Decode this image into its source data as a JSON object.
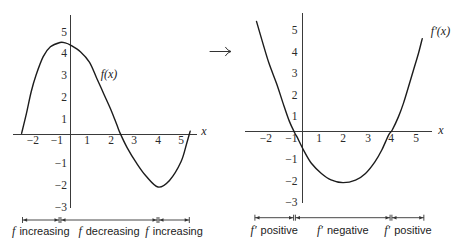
{
  "connector": {
    "icon": "long-right-arrow"
  },
  "colors": {
    "ink": "#1c1c1c",
    "axis": "#3a3a3a",
    "background": "#ffffff"
  },
  "chart_data": [
    {
      "type": "line",
      "title": "",
      "xlabel": "x",
      "ylabel": "",
      "x_ticks": [
        -2,
        -1,
        1,
        2,
        3,
        4,
        5
      ],
      "x_tick_labels": [
        "−2",
        "−1",
        "1",
        "2",
        "3",
        "4",
        "5"
      ],
      "y_ticks": [
        5,
        4,
        3,
        2,
        1,
        -1,
        -2,
        -3
      ],
      "y_tick_labels": [
        "5",
        "4",
        "3",
        "2",
        "1",
        "−1",
        "−2",
        "−3"
      ],
      "xlim": [
        -2.7,
        5.6
      ],
      "ylim": [
        -3.1,
        5.7
      ],
      "grid": false,
      "legend": "none",
      "series": [
        {
          "name": "f(x)",
          "label": "f(x)",
          "color": "#1c1c1c",
          "points": [
            [
              -2.6,
              0.35
            ],
            [
              -2.4,
              1.25
            ],
            [
              -2.2,
              2.25
            ],
            [
              -2.0,
              3.0
            ],
            [
              -1.7,
              3.85
            ],
            [
              -1.4,
              4.3
            ],
            [
              -1.0,
              4.5
            ],
            [
              -0.5,
              4.48
            ],
            [
              0,
              4.38
            ],
            [
              0.6,
              4.08
            ],
            [
              1.1,
              3.6
            ],
            [
              1.4,
              2.88
            ],
            [
              1.7,
              2.15
            ],
            [
              2.0,
              1.42
            ],
            [
              2.25,
              0.75
            ],
            [
              2.4,
              0.35
            ],
            [
              2.7,
              -0.3
            ],
            [
              3.1,
              -1.0
            ],
            [
              3.5,
              -1.6
            ],
            [
              4.0,
              -2.1
            ],
            [
              4.5,
              -1.8
            ],
            [
              5.0,
              -0.95
            ],
            [
              5.25,
              -0.1
            ],
            [
              5.4,
              0.45
            ]
          ]
        }
      ],
      "intervals": [
        {
          "fn": "f",
          "text": "increasing",
          "from": -2.6,
          "to": -1
        },
        {
          "fn": "f",
          "text": "decreasing",
          "from": -1,
          "to": 4
        },
        {
          "fn": "f",
          "text": "increasing",
          "from": 4,
          "to": 5.4
        }
      ]
    },
    {
      "type": "line",
      "title": "",
      "xlabel": "x",
      "ylabel": "",
      "x_ticks": [
        -2,
        -1,
        1,
        2,
        3,
        4,
        5
      ],
      "x_tick_labels": [
        "−2",
        "−1",
        "1",
        "2",
        "3",
        "4",
        "5"
      ],
      "y_ticks": [
        5,
        4,
        3,
        2,
        1,
        -1,
        -2,
        -3
      ],
      "y_tick_labels": [
        "5",
        "4",
        "3",
        "2",
        "1",
        "−1",
        "−2",
        "−3"
      ],
      "xlim": [
        -2.7,
        5.6
      ],
      "ylim": [
        -3.1,
        5.7
      ],
      "grid": false,
      "legend": "none",
      "series": [
        {
          "name": "f′(x)",
          "label": "f′(x)",
          "color": "#1c1c1c",
          "points": [
            [
              -2.5,
              5.4
            ],
            [
              -2.25,
              4.4
            ],
            [
              -2.0,
              3.45
            ],
            [
              -1.7,
              2.5
            ],
            [
              -1.45,
              1.6
            ],
            [
              -1.2,
              0.75
            ],
            [
              -0.95,
              0.2
            ],
            [
              -0.7,
              0.05
            ],
            [
              0.1,
              -0.6
            ],
            [
              0.55,
              -1.2
            ],
            [
              1.1,
              -1.67
            ],
            [
              1.5,
              -1.97
            ],
            [
              2.0,
              -2.1
            ],
            [
              2.5,
              -1.98
            ],
            [
              2.9,
              -1.67
            ],
            [
              3.3,
              -1.13
            ],
            [
              3.6,
              -0.58
            ],
            [
              3.9,
              0.12
            ],
            [
              4.05,
              0.35
            ],
            [
              4.3,
              0.97
            ],
            [
              4.5,
              1.6
            ],
            [
              4.7,
              2.36
            ],
            [
              4.9,
              3.14
            ],
            [
              5.1,
              3.92
            ],
            [
              5.25,
              4.6
            ]
          ]
        }
      ],
      "intervals": [
        {
          "fn": "f′",
          "text": "positive",
          "from": -2.6,
          "to": -1
        },
        {
          "fn": "f′",
          "text": "negative",
          "from": -1,
          "to": 4
        },
        {
          "fn": "f′",
          "text": "positive",
          "from": 4,
          "to": 5.35
        }
      ]
    }
  ]
}
